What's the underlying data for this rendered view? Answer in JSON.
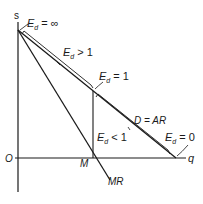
{
  "diagram": {
    "type": "monopoly demand and marginal revenue elasticity diagram",
    "axes": {
      "y_label": "s",
      "x_label": "q",
      "origin_label": "O"
    },
    "curves": {
      "demand_label": "D = AR",
      "mr_label": "MR"
    },
    "points": {
      "m_label": "M"
    },
    "elasticity_labels": {
      "infinite": {
        "sym": "E",
        "sub": "d",
        "rest": " = ∞"
      },
      "elastic": {
        "sym": "E",
        "sub": "d",
        "rest": " > 1"
      },
      "unit": {
        "sym": "E",
        "sub": "d",
        "rest": " = 1"
      },
      "inelastic": {
        "sym": "E",
        "sub": "d",
        "rest": " < 1"
      },
      "zero": {
        "sym": "E",
        "sub": "d",
        "rest": " = 0"
      }
    },
    "colors": {
      "line": "#1a1a1a",
      "background": "#ffffff"
    }
  }
}
